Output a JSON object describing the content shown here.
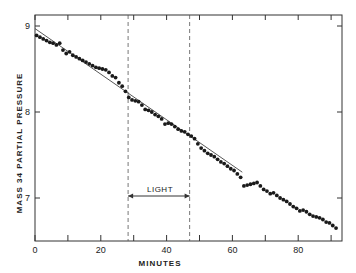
{
  "chart_data": {
    "type": "scatter",
    "title": "",
    "xlabel": "MINUTES",
    "ylabel": "MASS 34 PARTIAL PRESSURE",
    "xlim": [
      0,
      93
    ],
    "ylim": [
      6.5,
      9.13
    ],
    "xticks": [
      0,
      10,
      20,
      30,
      40,
      50,
      60,
      70,
      80,
      90
    ],
    "xtick_labels": [
      "0",
      "20",
      "40",
      "60",
      "80"
    ],
    "xtick_label_values": [
      0,
      20,
      40,
      60,
      80
    ],
    "yticks": [
      7,
      8,
      9
    ],
    "ytick_labels": [
      "7",
      "8",
      "9"
    ],
    "grid": false,
    "legend": null,
    "series": [
      {
        "name": "data",
        "marker": "filled-circle",
        "x": [
          0.5,
          1.5,
          2.5,
          3.5,
          4.5,
          5.5,
          6.5,
          7.5,
          8.5,
          9.5,
          10.5,
          11.5,
          12.5,
          13.5,
          14.5,
          15.5,
          16.5,
          17.5,
          18.5,
          19.5,
          20.5,
          21.5,
          22.5,
          23.5,
          24.5,
          25.5,
          26.5,
          27.5,
          28.5,
          29.5,
          30.5,
          31.5,
          32.5,
          33.5,
          34.5,
          35.5,
          36.5,
          37.5,
          38.5,
          39.5,
          40.5,
          41.5,
          42.5,
          43.5,
          44.5,
          45.5,
          46.5,
          47.5,
          48.5,
          49.5,
          50.5,
          51.5,
          52.5,
          53.5,
          54.5,
          55.5,
          56.5,
          57.5,
          58.5,
          59.5,
          60.5,
          61.5,
          62.5,
          63.5,
          64.5,
          65.5,
          66.5,
          67.5,
          68.5,
          69.5,
          70.5,
          71.5,
          72.5,
          73.5,
          74.5,
          75.5,
          76.5,
          77.5,
          78.5,
          79.5,
          80.5,
          81.5,
          82.5,
          83.5,
          84.5,
          85.5,
          86.5,
          87.5,
          88.5,
          89.5,
          90.5,
          91.5
        ],
        "y": [
          8.89,
          8.87,
          8.85,
          8.83,
          8.81,
          8.8,
          8.78,
          8.8,
          8.72,
          8.68,
          8.7,
          8.66,
          8.64,
          8.62,
          8.6,
          8.58,
          8.56,
          8.54,
          8.52,
          8.51,
          8.5,
          8.49,
          8.46,
          8.42,
          8.4,
          8.34,
          8.3,
          8.24,
          8.17,
          8.14,
          8.13,
          8.12,
          8.08,
          8.03,
          8.02,
          8.0,
          7.97,
          7.95,
          7.92,
          7.86,
          7.87,
          7.86,
          7.83,
          7.8,
          7.78,
          7.77,
          7.74,
          7.72,
          7.69,
          7.63,
          7.58,
          7.55,
          7.52,
          7.5,
          7.48,
          7.45,
          7.42,
          7.4,
          7.37,
          7.34,
          7.32,
          7.28,
          7.24,
          7.14,
          7.15,
          7.16,
          7.17,
          7.18,
          7.14,
          7.1,
          7.08,
          7.05,
          7.06,
          7.03,
          7.0,
          6.98,
          6.96,
          6.93,
          6.9,
          6.88,
          6.85,
          6.86,
          6.84,
          6.81,
          6.79,
          6.78,
          6.77,
          6.75,
          6.72,
          6.71,
          6.68,
          6.65
        ]
      },
      {
        "name": "fit-line",
        "type": "line",
        "x": [
          0,
          63
        ],
        "y": [
          8.97,
          7.3
        ]
      }
    ],
    "annotations": [
      {
        "type": "vline",
        "x": 28.3,
        "style": "dashed"
      },
      {
        "type": "vline",
        "x": 47.0,
        "style": "dashed"
      },
      {
        "type": "double-arrow",
        "x_start": 28.3,
        "x_end": 47.0,
        "y": 7.0,
        "label": "LIGHT"
      }
    ]
  },
  "labels": {
    "xlabel": "MINUTES",
    "ylabel": "MASS 34 PARTIAL PRESSURE",
    "annotation": "LIGHT"
  }
}
